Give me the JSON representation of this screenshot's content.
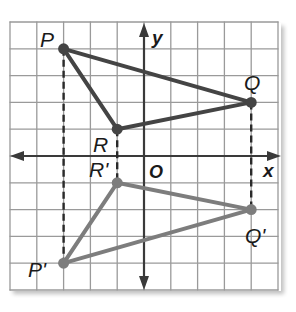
{
  "diagram": {
    "type": "coordinate-plane-reflection",
    "grid": {
      "x_min": -5,
      "x_max": 5,
      "y_min": -5,
      "y_max": 5,
      "unit_px": 27
    },
    "axes": {
      "x_label": "x",
      "y_label": "y",
      "origin_label": "O"
    },
    "original_triangle": {
      "color": "#444444",
      "vertices": [
        {
          "name": "P",
          "x": -3,
          "y": 4
        },
        {
          "name": "Q",
          "x": 4,
          "y": 2
        },
        {
          "name": "R",
          "x": -1,
          "y": 1
        }
      ]
    },
    "image_triangle": {
      "color": "#7d7d7d",
      "vertices": [
        {
          "name": "P'",
          "x": -3,
          "y": -4
        },
        {
          "name": "Q'",
          "x": 4,
          "y": -2
        },
        {
          "name": "R'",
          "x": -1,
          "y": -1
        }
      ]
    },
    "dashed_connectors": [
      {
        "from": "P",
        "to": "P'"
      },
      {
        "from": "Q",
        "to": "Q'"
      },
      {
        "from": "R",
        "to": "R'"
      }
    ],
    "colors": {
      "grid": "#9a9a9a",
      "axis": "#3a3a3a",
      "dashed": "#2a2a2a"
    }
  },
  "labels": {
    "P": "P",
    "Q": "Q",
    "R": "R",
    "P_prime": "P'",
    "Q_prime": "Q'",
    "R_prime": "R'",
    "x": "x",
    "y": "y",
    "origin": "O"
  }
}
